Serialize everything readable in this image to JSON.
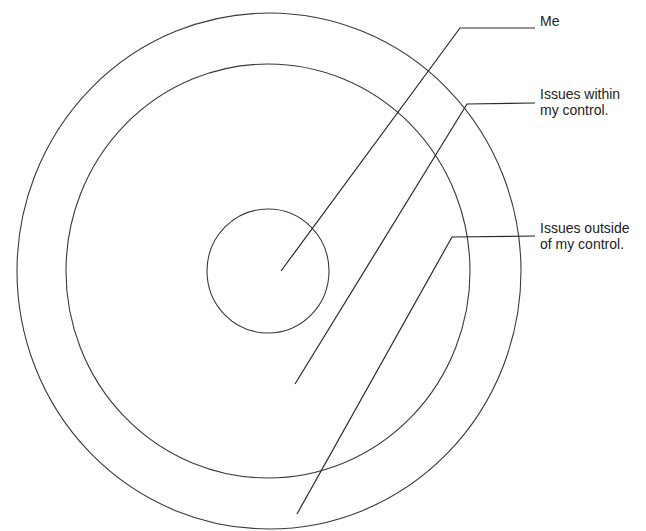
{
  "diagram": {
    "type": "concentric circles of control",
    "stroke_color": "#333333",
    "background": "#ffffff",
    "rings": [
      {
        "name": "inner",
        "represents": "Me"
      },
      {
        "name": "middle",
        "represents": "Issues within my control."
      },
      {
        "name": "outer",
        "represents": "Issues outside of my control."
      }
    ],
    "labels": {
      "me": "Me",
      "within": "Issues within\nmy control.",
      "outside": "Issues outside\nof my control."
    }
  }
}
